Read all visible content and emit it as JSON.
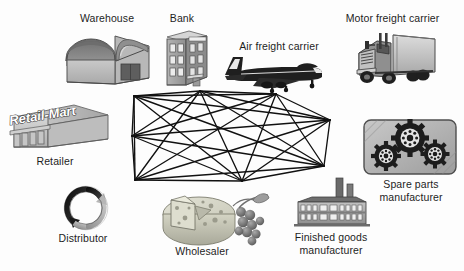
{
  "diagram": {
    "background_color": "#fdfdfd",
    "ink_color": "#1b1b1b"
  },
  "center": {
    "name": "supply-chain-mesh-network",
    "description": "Dense fully-connected mesh network drawn as a flat elongated polyhedron",
    "node_count": 8,
    "edge_style": "solid black lines",
    "nodes": [
      {
        "id": "n1",
        "x": 6,
        "y": 48
      },
      {
        "id": "n2",
        "x": 8,
        "y": 8
      },
      {
        "id": "n3",
        "x": 74,
        "y": 3
      },
      {
        "id": "n4",
        "x": 150,
        "y": 6
      },
      {
        "id": "n5",
        "x": 204,
        "y": 32
      },
      {
        "id": "n6",
        "x": 198,
        "y": 78
      },
      {
        "id": "n7",
        "x": 116,
        "y": 93
      },
      {
        "id": "n8",
        "x": 9,
        "y": 92
      }
    ]
  },
  "entities": [
    {
      "id": "warehouse",
      "label": "Warehouse",
      "icon": "warehouse-icon",
      "label_left": 62,
      "label_top": 12,
      "label_width": 90
    },
    {
      "id": "bank",
      "label": "Bank",
      "icon": "bank-building-icon",
      "label_left": 152,
      "label_top": 12,
      "label_width": 60
    },
    {
      "id": "air-freight-carrier",
      "label": "Air freight carrier",
      "icon": "airplane-icon",
      "label_left": 224,
      "label_top": 40,
      "label_width": 110
    },
    {
      "id": "motor-freight-carrier",
      "label": "Motor freight carrier",
      "icon": "truck-icon",
      "label_left": 330,
      "label_top": 12,
      "label_width": 125
    },
    {
      "id": "retailer",
      "label": "Retailer",
      "icon": "retail-store-icon",
      "sign_text": "Retail-Mart",
      "label_left": 10,
      "label_top": 155,
      "label_width": 90
    },
    {
      "id": "distributor",
      "label": "Distributor",
      "icon": "circular-arrows-icon",
      "label_left": 38,
      "label_top": 232,
      "label_width": 90
    },
    {
      "id": "wholesaler",
      "label": "Wholesaler",
      "icon": "cheese-and-grapes-icon",
      "label_left": 152,
      "label_top": 245,
      "label_width": 100
    },
    {
      "id": "finished-goods-manufacturer",
      "label": "Finished goods manufacturer",
      "label_line1": "Finished goods",
      "label_line2": "manufacturer",
      "icon": "factory-icon",
      "label_left": 275,
      "label_top": 231,
      "label_width": 110
    },
    {
      "id": "spare-parts-manufacturer",
      "label": "Spare parts manufacturer",
      "label_line1": "Spare parts",
      "label_line2": "manufacturer",
      "icon": "gears-plate-icon",
      "label_left": 360,
      "label_top": 178,
      "label_width": 102
    }
  ]
}
